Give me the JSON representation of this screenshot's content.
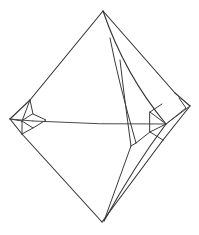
{
  "figure": {
    "kind": "crystal-form-line-drawing",
    "background_color": "#ffffff",
    "stroke_color": "#333333",
    "stroke_color_secondary": "#3a3a3a",
    "stroke_color_soft": "#4a4a4a",
    "stroke_width": 1.1,
    "canvas": {
      "width": 199,
      "height": 235
    }
  },
  "vertices": {
    "top": {
      "x": 103,
      "y": 11
    },
    "bottom": {
      "x": 102,
      "y": 222
    },
    "left_outer": {
      "x": 9,
      "y": 120
    },
    "right_outer": {
      "x": 190,
      "y": 106
    },
    "left_girdle": {
      "x": 31,
      "y": 120
    },
    "right_girdle": {
      "x": 166,
      "y": 124
    },
    "left_upper_break": {
      "x": 30,
      "y": 100
    },
    "left_lower_break": {
      "x": 22,
      "y": 134
    },
    "right_upper_break": {
      "x": 172,
      "y": 94
    },
    "right_lower_break": {
      "x": 160,
      "y": 141
    }
  },
  "outline_edges": [
    {
      "name": "upper-left-edge",
      "from": "top",
      "to": "left_upper_break"
    },
    {
      "name": "lower-left-edge",
      "from": "left_lower_break",
      "to": "bottom"
    },
    {
      "name": "upper-right-edge",
      "from": "top",
      "to": "right_upper_break"
    },
    {
      "name": "lower-right-edge",
      "from": "right_lower_break",
      "to": "bottom"
    },
    {
      "name": "left-bevel-upper",
      "from": "left_upper_break",
      "to": "left_outer"
    },
    {
      "name": "left-bevel-lower",
      "from": "left_outer",
      "to": "left_lower_break"
    },
    {
      "name": "right-bevel-upper",
      "from": "right_upper_break",
      "to": "right_outer"
    },
    {
      "name": "right-bevel-lower",
      "from": "right_outer",
      "to": "right_lower_break"
    }
  ],
  "interior_edges": [
    {
      "name": "central-girdle-line",
      "from": "left_girdle",
      "to": "right_girdle"
    },
    {
      "name": "top-to-right-girdle-facet-edge",
      "from": "top",
      "to": "right_girdle"
    },
    {
      "name": "right-facet-parallel-line",
      "note": "thin line parallel to top-to-right-girdle edge"
    },
    {
      "name": "bottom-to-right-girdle-facet-edge",
      "from": "right_girdle",
      "to": "bottom"
    },
    {
      "name": "left-vertex-bevel-facets",
      "note": "small quadrilateral truncation at left lateral vertex"
    },
    {
      "name": "right-vertex-bevel-facets",
      "note": "small triangular truncation at right lateral vertex"
    }
  ],
  "labels": {
    "caption": ""
  }
}
